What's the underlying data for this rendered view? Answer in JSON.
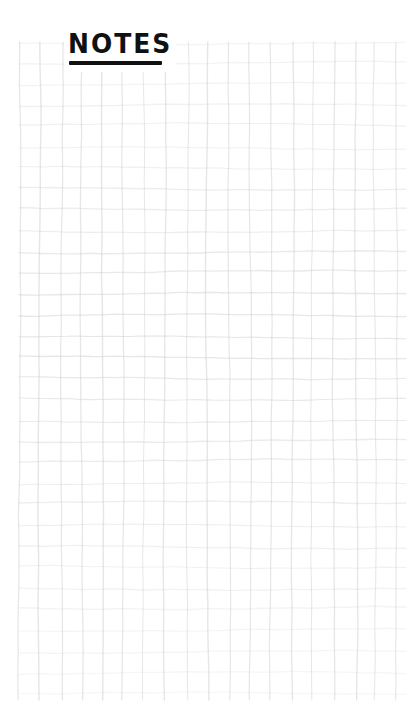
{
  "page": {
    "kind": "handdrawn-grid-note-page",
    "background_color": "#ffffff",
    "width": 407,
    "height": 725
  },
  "title": {
    "text": "NOTES",
    "style": "hand-lettered-marker-caps",
    "color": "#111111",
    "underlined": true,
    "underline_color": "#111111"
  },
  "grid": {
    "label": "notebook-grid",
    "line_color": "#e0e0e0",
    "line_color_strong": "#d2d2d2",
    "cell_size": 21,
    "columns": 19,
    "rows": 31,
    "origin_x": 19,
    "origin_y": 42,
    "end_x": 406,
    "end_y": 700,
    "hand_drawn": true
  },
  "content": {
    "body_text": "",
    "note_lines": []
  }
}
